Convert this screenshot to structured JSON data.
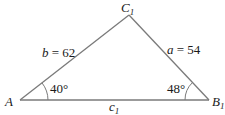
{
  "diagram": {
    "type": "triangle",
    "colors": {
      "stroke": "#7a7a7a",
      "text": "#1a1a1a",
      "background": "#ffffff"
    },
    "vertices": [
      {
        "id": "A",
        "name": "A",
        "subscript": ""
      },
      {
        "id": "B1",
        "name": "B",
        "subscript": "1"
      },
      {
        "id": "C1",
        "name": "C",
        "subscript": "1"
      }
    ],
    "sides": {
      "b": {
        "var": "b",
        "eq": " = ",
        "value": "62"
      },
      "a": {
        "var": "a",
        "eq": " = ",
        "value": "54"
      },
      "c": {
        "var": "c",
        "subscript": "1"
      }
    },
    "angles": {
      "A": {
        "value": "40°"
      },
      "B1": {
        "value": "48°"
      }
    }
  }
}
